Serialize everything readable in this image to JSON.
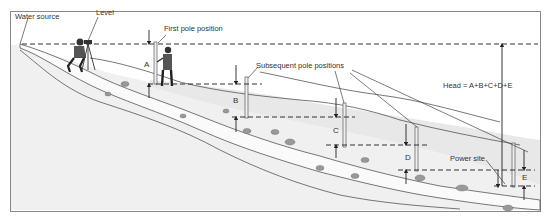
{
  "diagram": {
    "labels": {
      "water_source": "Water source",
      "level": "Level",
      "first_pole": "First pole position",
      "subsequent_poles": "Subsequent pole positions",
      "head_formula": "Head = A+B+C+D+E",
      "power_site": "Power site"
    },
    "segments": [
      {
        "letter": "A"
      },
      {
        "letter": "B"
      },
      {
        "letter": "C"
      },
      {
        "letter": "D"
      },
      {
        "letter": "E"
      }
    ],
    "colors": {
      "background": "#ffffff",
      "frame": "#888888",
      "ink": "#333333",
      "ground_shade": "#ececec",
      "water": "#f6f6f6"
    }
  }
}
